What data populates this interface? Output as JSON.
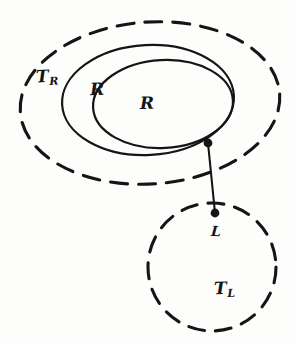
{
  "diagram": {
    "background_color": "#fdfdfc",
    "ink_color": "#151515",
    "shapes": [
      {
        "id": "outer-dashed-ellipse",
        "name": "T_R boundary",
        "type": "ellipse",
        "stroke_style": "dashed",
        "cx": 150,
        "cy": 103,
        "rx": 130,
        "ry": 81,
        "rotation": -4
      },
      {
        "id": "middle-solid-ellipse",
        "name": "R' boundary",
        "type": "ellipse",
        "stroke_style": "solid",
        "cx": 148,
        "cy": 100,
        "rx": 86,
        "ry": 55,
        "rotation": -3
      },
      {
        "id": "inner-solid-ellipse",
        "name": "R boundary",
        "type": "ellipse",
        "stroke_style": "solid",
        "cx": 163,
        "cy": 104,
        "rx": 70,
        "ry": 44,
        "rotation": -3
      },
      {
        "id": "lower-dashed-circle",
        "name": "T_L boundary",
        "type": "circle",
        "stroke_style": "dashed",
        "cx": 212,
        "cy": 267,
        "rx": 64,
        "ry": 64,
        "rotation": 0
      }
    ],
    "points": [
      {
        "id": "junction-point",
        "name": "boundary attachment point",
        "x": 208,
        "y": 143,
        "radius": 4.2,
        "filled": true
      },
      {
        "id": "l-point",
        "name": "point L",
        "x": 215,
        "y": 213,
        "radius": 4.2,
        "filled": true
      }
    ],
    "connector": {
      "id": "link-line",
      "name": "link from R boundary to L",
      "stroke_style": "solid",
      "from_x": 208,
      "from_y": 143,
      "to_x": 215,
      "to_y": 213
    },
    "labels": {
      "t_r": {
        "base": "T",
        "sub": "R"
      },
      "r_prime": {
        "base": "R",
        "prime": "′"
      },
      "r": {
        "base": "R"
      },
      "l": {
        "base": "L"
      },
      "t_l": {
        "base": "T",
        "sub": "L"
      }
    }
  }
}
